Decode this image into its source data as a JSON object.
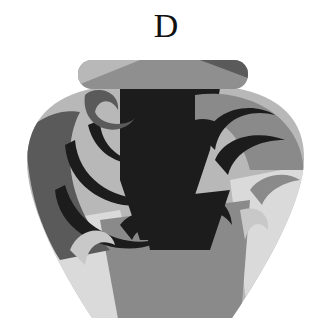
{
  "option_label": "D",
  "figure": {
    "colors": {
      "dark": "#1c1c1c",
      "mid_dark": "#5a5a5a",
      "mid": "#8a8a8a",
      "light": "#b8b8b8",
      "lightest": "#dadada"
    }
  }
}
